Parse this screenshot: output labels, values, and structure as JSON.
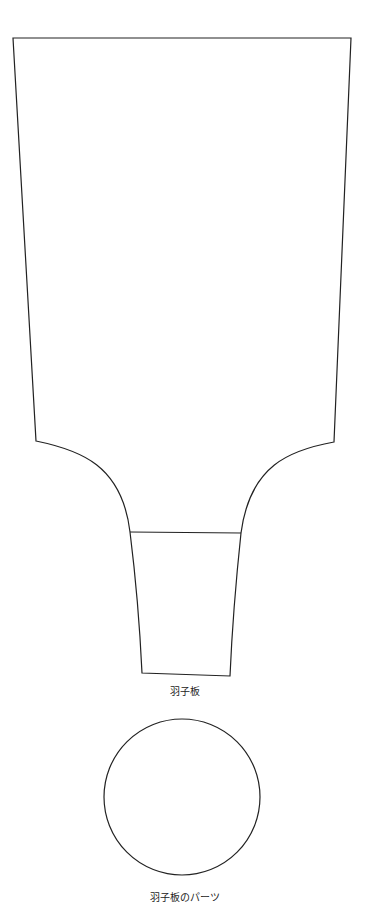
{
  "diagram": {
    "stroke_color": "#222222",
    "background": "#ffffff",
    "shapes": {
      "paddle": {
        "label": "羽子板",
        "top_left": [
          13,
          38
        ],
        "top_right": [
          351,
          38
        ],
        "body_bottom_left": [
          36,
          441
        ],
        "body_bottom_right": [
          334,
          442
        ],
        "neck_left": [
          130,
          532
        ],
        "neck_right": [
          241,
          533
        ],
        "handle_bottom_left": [
          142,
          673
        ],
        "handle_bottom_right": [
          230,
          676
        ]
      },
      "part_circle": {
        "label": "羽子板のパーツ",
        "cx": 182,
        "cy": 797,
        "r": 78
      }
    }
  }
}
